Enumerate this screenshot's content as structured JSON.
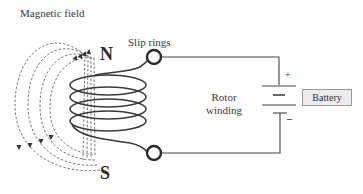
{
  "diagram": {
    "labels": {
      "magnetic_field": "Magnetic field",
      "slip_rings": "Slip rings",
      "rotor_winding_line1": "Rotor",
      "rotor_winding_line2": "winding",
      "north_pole": "N",
      "south_pole": "S",
      "battery": "Battery",
      "positive": "+",
      "negative": "−"
    },
    "components": [
      {
        "id": "field-lines",
        "type": "dashed-loops",
        "count": 4,
        "direction_top": "up",
        "direction_left": "down"
      },
      {
        "id": "rotor-coil",
        "type": "helical-winding",
        "turns": 4
      },
      {
        "id": "slip-ring-top",
        "type": "ring",
        "connects": "battery-positive"
      },
      {
        "id": "slip-ring-bottom",
        "type": "ring",
        "connects": "battery-negative"
      },
      {
        "id": "battery",
        "type": "dc-source",
        "plates": 2
      }
    ],
    "colors": {
      "line": "#3a3a3a",
      "dashed": "#555555",
      "battery_fill": "#ececec",
      "battery_border": "#9a9a9a"
    }
  }
}
